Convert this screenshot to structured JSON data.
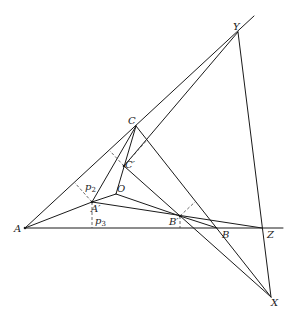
{
  "diagram": {
    "stroke_color": "#1a1a1a",
    "dash_color": "#444444",
    "points": {
      "A": {
        "label": "A",
        "x": 25,
        "y": 228
      },
      "B": {
        "label": "B",
        "x": 217,
        "y": 228
      },
      "C": {
        "label": "C",
        "x": 136,
        "y": 126
      },
      "O": {
        "label": "O",
        "x": 116,
        "y": 194
      },
      "A1": {
        "label": "A′",
        "x": 92,
        "y": 202
      },
      "B1": {
        "label": "B′",
        "x": 180,
        "y": 216
      },
      "C1": {
        "label": "C′",
        "x": 124,
        "y": 166
      },
      "X": {
        "label": "X",
        "x": 271,
        "y": 297
      },
      "Y": {
        "label": "Y",
        "x": 238,
        "y": 32
      },
      "Z": {
        "label": "Z",
        "x": 262,
        "y": 228
      }
    },
    "labels": {
      "A": "A",
      "B": "B",
      "C": "C",
      "O": "O",
      "A1": "A′",
      "B1": "B′",
      "C1": "C′",
      "X": "X",
      "Y": "Y",
      "Z": "Z",
      "p2_main": "p",
      "p2_sub": "2",
      "p3_main": "p",
      "p3_sub": "3"
    }
  }
}
